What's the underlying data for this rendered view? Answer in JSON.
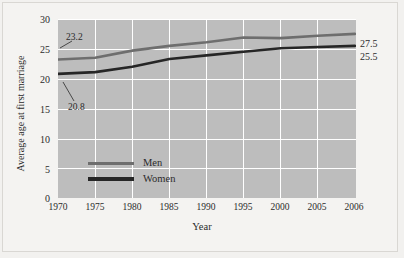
{
  "chart_data": {
    "type": "line",
    "title": "",
    "xlabel": "Year",
    "ylabel": "Average age at first marriage",
    "x": [
      1970,
      1975,
      1980,
      1985,
      1990,
      1995,
      2000,
      2005,
      2006
    ],
    "xtick_labels": [
      "1970",
      "1975",
      "1980",
      "1985",
      "1990",
      "1995",
      "2000",
      "2005",
      "2006"
    ],
    "ytick_labels": [
      "0",
      "5",
      "10",
      "15",
      "20",
      "25",
      "30"
    ],
    "yticks": [
      0,
      5,
      10,
      15,
      20,
      25,
      30
    ],
    "ylim": [
      0,
      30
    ],
    "grid": true,
    "legend_position": "inside-lower-left",
    "series": [
      {
        "name": "Men",
        "color": "#6e6e6e",
        "values": [
          23.2,
          23.5,
          24.7,
          25.5,
          26.1,
          26.9,
          26.8,
          27.2,
          27.5
        ]
      },
      {
        "name": "Women",
        "color": "#262626",
        "values": [
          20.8,
          21.1,
          22.0,
          23.3,
          23.9,
          24.5,
          25.1,
          25.3,
          25.5
        ]
      }
    ],
    "annotations": [
      {
        "text": "23.2",
        "series": "Men",
        "x": 1970,
        "value": 23.2
      },
      {
        "text": "20.8",
        "series": "Women",
        "x": 1970,
        "value": 20.8
      },
      {
        "text": "27.5",
        "series": "Men",
        "x": 2006,
        "value": 27.5
      },
      {
        "text": "25.5",
        "series": "Women",
        "x": 2006,
        "value": 25.5
      }
    ]
  },
  "legend": {
    "items": [
      {
        "label": "Men"
      },
      {
        "label": "Women"
      }
    ]
  },
  "colors": {
    "men_line": "#6e6e6e",
    "women_line": "#262626",
    "plot_background": "#bdbdbd",
    "grid": "#ffffff",
    "figure_background": "#f2f1ef"
  }
}
